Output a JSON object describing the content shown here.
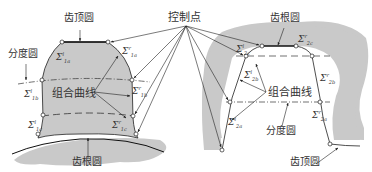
{
  "diagram": {
    "type": "gear-tooth-profile",
    "colors": {
      "material": "#c9c9c9",
      "line": "#222222",
      "text": "#333333",
      "background": "#ffffff"
    },
    "center_label": "控制点",
    "left": {
      "title": "external-gear-tooth",
      "labels": {
        "tip_circle": "齿顶圆",
        "pitch_circle": "分度圆",
        "composite_curve": "组合曲线",
        "root_circle": "齿根圆"
      },
      "segments": {
        "s1a_left": {
          "sym": "Σ",
          "sup": "l",
          "sub": "1a"
        },
        "s1a_right": {
          "sym": "Σ",
          "sup": "r",
          "sub": "1a"
        },
        "s1b_left": {
          "sym": "Σ",
          "sup": "l",
          "sub": "1b"
        },
        "s1b_right": {
          "sym": "Σ",
          "sup": "r",
          "sub": "1b"
        },
        "s1c_left": {
          "sym": "Σ",
          "sup": "l",
          "sub": "1c"
        },
        "s1c_right": {
          "sym": "Σ",
          "sup": "r",
          "sub": "1c"
        }
      }
    },
    "right": {
      "title": "internal-gear-tooth",
      "labels": {
        "root_circle": "齿根圆",
        "composite_curve": "组合曲线",
        "pitch_circle": "分度圆",
        "tip_circle": "齿顶圆"
      },
      "segments": {
        "s2c_left": {
          "sym": "Σ",
          "sup": "l",
          "sub": "2c"
        },
        "s2c_right": {
          "sym": "Σ",
          "sup": "r",
          "sub": "2c"
        },
        "s2b_left": {
          "sym": "Σ",
          "sup": "l",
          "sub": "2b"
        },
        "s2b_right": {
          "sym": "Σ",
          "sup": "r",
          "sub": "2b"
        },
        "s2a_left": {
          "sym": "Σ",
          "sup": "l",
          "sub": "2a"
        },
        "s2a_right": {
          "sym": "Σ",
          "sup": "r",
          "sub": "2a"
        }
      }
    }
  }
}
